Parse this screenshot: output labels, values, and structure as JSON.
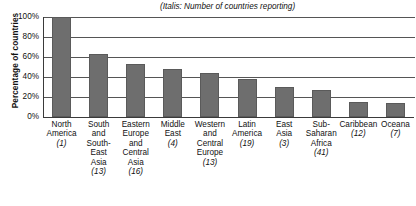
{
  "chart_data": {
    "type": "bar",
    "note": "(Italis: Number of countries reporting)",
    "xlabel": "",
    "ylabel": "Percentage of countries",
    "ylim": [
      0,
      100
    ],
    "grid": true,
    "legend": "none",
    "ytick_labels": [
      "100%",
      "80%",
      "60%",
      "40%",
      "20%",
      "0%"
    ],
    "ytick_values": [
      100,
      80,
      60,
      40,
      20,
      0
    ],
    "categories": [
      "North America",
      "South and South-East Asia",
      "Eastern Europe and Central Asia",
      "Middle East",
      "Western and Central Europe",
      "Latin America",
      "East Asia",
      "Sub-Saharan Africa",
      "Caribbean",
      "Oceana"
    ],
    "category_lines": [
      [
        "North",
        "America"
      ],
      [
        "South",
        "and",
        "South-",
        "East",
        "Asia"
      ],
      [
        "Eastern",
        "Europe",
        "and",
        "Central",
        "Asia"
      ],
      [
        "Middle",
        "East"
      ],
      [
        "Western",
        "and",
        "Central",
        "Europe"
      ],
      [
        "Latin",
        "America"
      ],
      [
        "East",
        "Asia"
      ],
      [
        "Sub-",
        "Saharan",
        "Africa"
      ],
      [
        "Caribbean"
      ],
      [
        "Oceana"
      ]
    ],
    "counts": [
      1,
      13,
      16,
      4,
      13,
      19,
      3,
      41,
      12,
      7
    ],
    "count_labels": [
      "(1)",
      "(13)",
      "(16)",
      "(4)",
      "(13)",
      "(19)",
      "(3)",
      "(41)",
      "(12)",
      "(7)"
    ],
    "values": [
      100,
      63,
      53,
      48,
      44,
      38,
      30,
      27,
      15,
      14
    ],
    "bar_color": "#6e6e6e",
    "axis_color": "#3a3a3a",
    "gridline_color": "#555555",
    "background_color": "#ffffff"
  },
  "axis": {
    "y_title": "Percentage of countries"
  }
}
